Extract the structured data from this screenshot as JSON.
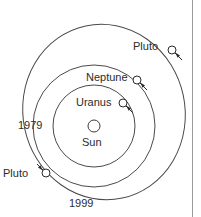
{
  "diagram": {
    "type": "orbital-diagram",
    "background_color": "#ffffff",
    "stroke_color": "#4a4a4a",
    "text_color": "#2b2b2b",
    "center": {
      "x": 94,
      "y": 126
    },
    "sun": {
      "label": "Sun",
      "marker": "open-circle",
      "cx": 94,
      "cy": 126,
      "r": 6
    },
    "orbits": [
      {
        "name": "uranus-orbit",
        "shape": "circle",
        "cx": 94,
        "cy": 126,
        "r": 41
      },
      {
        "name": "neptune-orbit",
        "shape": "circle",
        "cx": 94,
        "cy": 126,
        "r": 61
      },
      {
        "name": "pluto-orbit",
        "shape": "ellipse",
        "cx": 104,
        "cy": 112,
        "rx": 81,
        "ry": 88,
        "rotation_deg": -12
      }
    ],
    "bodies": [
      {
        "name": "pluto-1979-marker",
        "label": "Pluto",
        "marker": "open-circle",
        "cx": 172,
        "cy": 50,
        "r": 4,
        "direction": "clockwise"
      },
      {
        "name": "neptune-marker",
        "label": "Neptune",
        "marker": "open-circle",
        "cx": 137,
        "cy": 80,
        "r": 4,
        "direction": "clockwise"
      },
      {
        "name": "uranus-marker",
        "label": "Uranus",
        "marker": "open-circle",
        "cx": 123,
        "cy": 103,
        "r": 4,
        "direction": "clockwise"
      },
      {
        "name": "pluto-1999-marker",
        "label": "Pluto",
        "marker": "open-circle",
        "cx": 46,
        "cy": 173,
        "r": 4,
        "direction": "clockwise"
      }
    ],
    "year_labels": [
      {
        "name": "year-1979",
        "text": "1979"
      },
      {
        "name": "year-1999",
        "text": "1999"
      }
    ],
    "labels": {
      "pluto_top": "Pluto",
      "neptune": "Neptune",
      "uranus": "Uranus",
      "sun": "Sun",
      "year_1979": "1979",
      "pluto_bottom": "Pluto",
      "year_1999": "1999"
    }
  }
}
